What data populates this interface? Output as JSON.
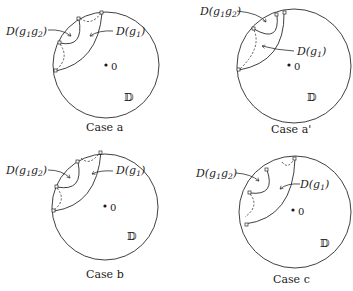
{
  "figure": {
    "labels": {
      "region_g1g2_prefix": "D(g",
      "region_g1g2_sub1": "1",
      "region_g1g2_mid": "g",
      "region_g1g2_sub2": "2",
      "region_g1g2_suffix": ")",
      "region_g1_prefix": "D(g",
      "region_g1_sub": "1",
      "region_g1_suffix": ")",
      "origin": "0",
      "disk": "𝔻"
    },
    "panels": [
      {
        "id": "a",
        "caption": "Case a"
      },
      {
        "id": "a_prime",
        "caption": "Case a'"
      },
      {
        "id": "b",
        "caption": "Case b"
      },
      {
        "id": "c",
        "caption": "Case c"
      }
    ],
    "colors": {
      "stroke": "#2a2a2a",
      "background": "#ffffff"
    }
  }
}
